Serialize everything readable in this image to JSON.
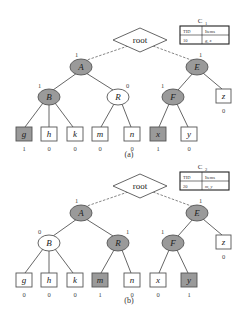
{
  "colors": {
    "selected_fill": "#9a9a9a",
    "unselected_fill": "#ffffff",
    "stroke": "#555555"
  },
  "panels": [
    {
      "caption": "(a)",
      "table": {
        "title": "C",
        "subscript": "1",
        "headers": [
          "TID",
          "Items"
        ],
        "row": [
          "10",
          "g, x"
        ]
      },
      "root": "root",
      "nodes": {
        "A": {
          "label": "A",
          "count": "1",
          "selected": true
        },
        "E": {
          "label": "E",
          "count": "1",
          "selected": true
        },
        "B": {
          "label": "B",
          "count": "1",
          "selected": true
        },
        "R": {
          "label": "R",
          "count": "0",
          "selected": false
        },
        "F": {
          "label": "F",
          "count": "1",
          "selected": true
        },
        "z": {
          "label": "z",
          "count": "0",
          "selected": false
        }
      },
      "leaves": [
        {
          "label": "g",
          "count": "1",
          "selected": true
        },
        {
          "label": "h",
          "count": "0",
          "selected": false
        },
        {
          "label": "k",
          "count": "0",
          "selected": false
        },
        {
          "label": "m",
          "count": "0",
          "selected": false
        },
        {
          "label": "n",
          "count": "0",
          "selected": false
        },
        {
          "label": "x",
          "count": "1",
          "selected": true
        },
        {
          "label": "y",
          "count": "0",
          "selected": false
        }
      ]
    },
    {
      "caption": "(b)",
      "table": {
        "title": "C",
        "subscript": "2",
        "headers": [
          "TID",
          "Items"
        ],
        "row": [
          "20",
          "m, y"
        ]
      },
      "root": "root",
      "nodes": {
        "A": {
          "label": "A",
          "count": "1",
          "selected": true
        },
        "E": {
          "label": "E",
          "count": "1",
          "selected": true
        },
        "B": {
          "label": "B",
          "count": "0",
          "selected": false
        },
        "R": {
          "label": "R",
          "count": "1",
          "selected": true
        },
        "F": {
          "label": "F",
          "count": "1",
          "selected": true
        },
        "z": {
          "label": "z",
          "count": "0",
          "selected": false
        }
      },
      "leaves": [
        {
          "label": "g",
          "count": "0",
          "selected": false
        },
        {
          "label": "h",
          "count": "0",
          "selected": false
        },
        {
          "label": "k",
          "count": "0",
          "selected": false
        },
        {
          "label": "m",
          "count": "1",
          "selected": true
        },
        {
          "label": "n",
          "count": "0",
          "selected": false
        },
        {
          "label": "x",
          "count": "0",
          "selected": false
        },
        {
          "label": "y",
          "count": "1",
          "selected": true
        }
      ]
    }
  ]
}
